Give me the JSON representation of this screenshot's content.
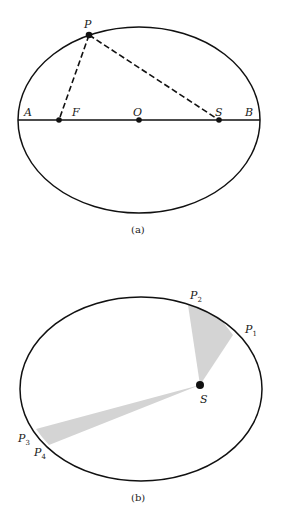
{
  "figure_a": {
    "caption": "(a)",
    "labels": {
      "P": "P",
      "A": "A",
      "F": "F",
      "O": "O",
      "S": "S",
      "B": "B"
    }
  },
  "figure_b": {
    "caption": "(b)",
    "labels": {
      "S": "S",
      "P1": "P",
      "P1_sub": "1",
      "P2": "P",
      "P2_sub": "2",
      "P3": "P",
      "P3_sub": "3",
      "P4": "P",
      "P4_sub": "4"
    }
  },
  "colors": {
    "stroke": "#111111",
    "wedge": "#d4d4d4",
    "background": "#ffffff"
  }
}
